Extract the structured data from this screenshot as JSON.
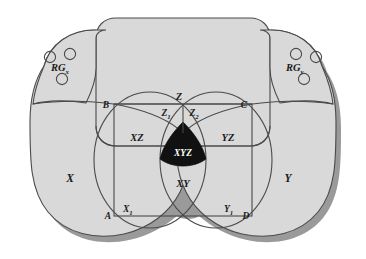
{
  "diagram": {
    "colors": {
      "region_fill": "#d9d9d9",
      "outline": "#4a4a4a",
      "shadow": "#9a9a9a",
      "intersection_fill": "#111111",
      "label_color": "#1a1a1a",
      "intersection_label_color": "#ffffff",
      "background": "#ffffff"
    },
    "reference_groups": [
      {
        "name": "rg-x",
        "label": "RG",
        "subscript": "x",
        "circle_count": 3
      },
      {
        "name": "rg-y",
        "label": "RG",
        "subscript": "y",
        "circle_count": 3
      }
    ],
    "set_labels": {
      "x": "X",
      "y": "Y",
      "z": "Z",
      "z1": "Z",
      "z1_sub": "1",
      "z2": "Z",
      "z2_sub": "2",
      "x1": "X",
      "x1_sub": "1",
      "y1": "Y",
      "y1_sub": "1",
      "xz": "XZ",
      "yz": "YZ",
      "xy": "XY",
      "xyz": "XYZ"
    },
    "rectangle_corners": {
      "top_left": "B",
      "top_right": "C",
      "bottom_left": "A",
      "bottom_right": "D"
    }
  }
}
